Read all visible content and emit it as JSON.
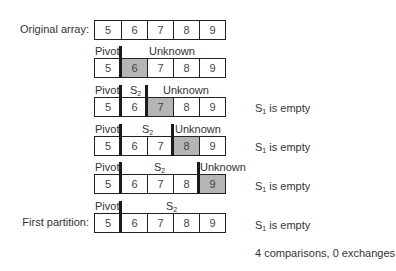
{
  "labels": {
    "original": "Original array:",
    "first_partition": "First partition:"
  },
  "segments": {
    "pivot": "Pivot",
    "unknown": "Unknown",
    "s2": "S",
    "s2_sub": "2"
  },
  "rows": [
    {
      "values": [
        "5",
        "6",
        "7",
        "8",
        "9"
      ],
      "highlight": -1
    },
    {
      "values": [
        "5",
        "6",
        "7",
        "8",
        "9"
      ],
      "highlight": 1
    },
    {
      "values": [
        "5",
        "6",
        "7",
        "8",
        "9"
      ],
      "highlight": 2
    },
    {
      "values": [
        "5",
        "6",
        "7",
        "8",
        "9"
      ],
      "highlight": 3
    },
    {
      "values": [
        "5",
        "6",
        "7",
        "8",
        "9"
      ],
      "highlight": 4
    },
    {
      "values": [
        "5",
        "6",
        "7",
        "8",
        "9"
      ],
      "highlight": -1
    }
  ],
  "notes": {
    "s1_empty_prefix": "S",
    "s1_empty_sub": "1",
    "s1_empty_suffix": " is empty",
    "summary": "4 comparisons, 0 exchanges"
  },
  "colors": {
    "highlight": "#b5b5b5",
    "border": "#222222"
  }
}
